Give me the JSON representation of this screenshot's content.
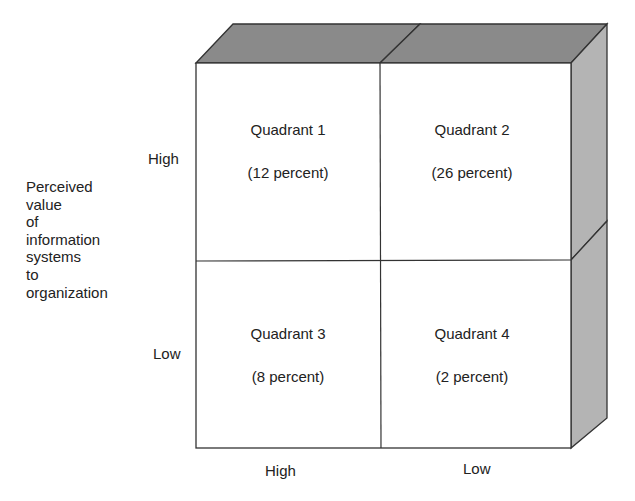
{
  "diagram": {
    "type": "quadrant-matrix-3d",
    "y_axis": {
      "label": "Perceived\nvalue\nof\ninformation\nsystems\nto\norganization",
      "ticks": [
        "High",
        "Low"
      ]
    },
    "x_axis": {
      "ticks": [
        "High",
        "Low"
      ]
    },
    "quadrants": [
      {
        "title": "Quadrant 1",
        "value": "(12 percent)"
      },
      {
        "title": "Quadrant 2",
        "value": "(26 percent)"
      },
      {
        "title": "Quadrant 3",
        "value": "(8 percent)"
      },
      {
        "title": "Quadrant 4",
        "value": "(2 percent)"
      }
    ],
    "colors": {
      "top_face": "#8a8a8a",
      "side_face": "#b4b4b4",
      "front_face": "#ffffff",
      "edge": "#333333"
    }
  }
}
